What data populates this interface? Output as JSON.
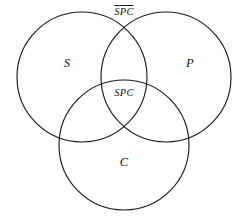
{
  "diagram": {
    "kind": "venn-diagram",
    "set_count": 3,
    "background_color": "#ffffff",
    "stroke_color": "#1a1a1a",
    "circles": [
      {
        "name": "S",
        "cx": 82,
        "cy": 77,
        "r": 65
      },
      {
        "name": "P",
        "cx": 166,
        "cy": 77,
        "r": 65
      },
      {
        "name": "C",
        "cx": 124,
        "cy": 145,
        "r": 65
      }
    ],
    "labels": {
      "set_s": "S",
      "set_p": "P",
      "set_c": "C",
      "intersection_all": "SPC",
      "complement_region": {
        "letters": [
          "S",
          "P",
          "C"
        ],
        "notation": "overline",
        "plain_text": "SPC"
      }
    }
  }
}
